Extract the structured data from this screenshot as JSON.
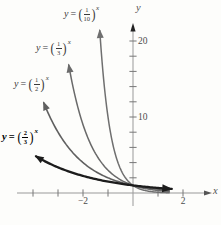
{
  "chart_data": {
    "type": "line",
    "xlabel": "x",
    "ylabel": "y",
    "xlim": [
      -4.6,
      3.1
    ],
    "ylim": [
      0,
      22
    ],
    "grid": false,
    "axis_color": "#999999",
    "tick_color": "#777777",
    "x_ticks": [
      -4,
      -3,
      -2,
      -1,
      1,
      2
    ],
    "y_ticks": [
      2,
      4,
      6,
      8,
      10,
      12,
      14,
      16,
      18,
      20
    ],
    "x_labeled_ticks": [
      {
        "v": -2,
        "text": "−2"
      },
      {
        "v": 2,
        "text": "2"
      }
    ],
    "y_labeled_ticks": [
      {
        "v": 10,
        "text": "10"
      },
      {
        "v": 20,
        "text": "20"
      }
    ],
    "series": [
      {
        "name": "y=(1/10)^x",
        "base": 0.1,
        "x_start": -1.33,
        "x_end": 1.45,
        "color": "#6f6f6f",
        "width": 1.5,
        "right_arrow": false,
        "label": {
          "lhs": "y",
          "rel": "=",
          "open": "(",
          "num": "1",
          "den": "10",
          "close": ")",
          "exp": "x"
        }
      },
      {
        "name": "y=(1/3)^x",
        "base": 0.333333,
        "x_start": -2.57,
        "x_end": 1.45,
        "color": "#6a6a6a",
        "width": 1.5,
        "right_arrow": false,
        "label": {
          "lhs": "y",
          "rel": "=",
          "open": "(",
          "num": "1",
          "den": "3",
          "close": ")",
          "exp": "x"
        }
      },
      {
        "name": "y=(1/2)^x",
        "base": 0.5,
        "x_start": -3.57,
        "x_end": 1.45,
        "color": "#606060",
        "width": 1.6,
        "right_arrow": false,
        "label": {
          "lhs": "y",
          "rel": "=",
          "open": "(",
          "num": "1",
          "den": "2",
          "close": ")",
          "exp": "x"
        }
      },
      {
        "name": "y=(2/3)^x",
        "base": 0.666667,
        "x_start": -3.88,
        "x_end": 1.55,
        "color": "#1c1c1c",
        "width": 2.3,
        "right_arrow": true,
        "label": {
          "lhs": "y",
          "rel": "=",
          "open": "(",
          "num": "2",
          "den": "3",
          "close": ")",
          "exp": "x"
        }
      }
    ]
  }
}
